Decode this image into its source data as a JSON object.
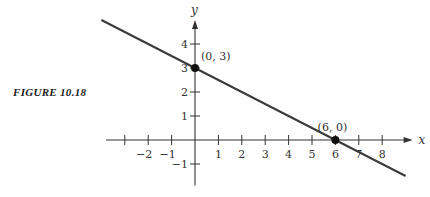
{
  "caption": "FIGURE 10.18",
  "chart_data": {
    "type": "line",
    "title": "",
    "xlabel": "x",
    "ylabel": "y",
    "x_ticks": [
      -2,
      -1,
      1,
      2,
      3,
      4,
      5,
      6,
      7,
      8
    ],
    "y_ticks": [
      -1,
      1,
      2,
      3,
      4
    ],
    "xlim": [
      -3.8,
      9.3
    ],
    "ylim": [
      -1.9,
      5
    ],
    "grid": false,
    "series": [
      {
        "name": "line",
        "x": [
          -4,
          9
        ],
        "y": [
          5,
          -1.5
        ]
      }
    ],
    "points": [
      {
        "x": 0,
        "y": 3,
        "label": "(0, 3)"
      },
      {
        "x": 6,
        "y": 0,
        "label": "(6, 0)"
      }
    ]
  }
}
